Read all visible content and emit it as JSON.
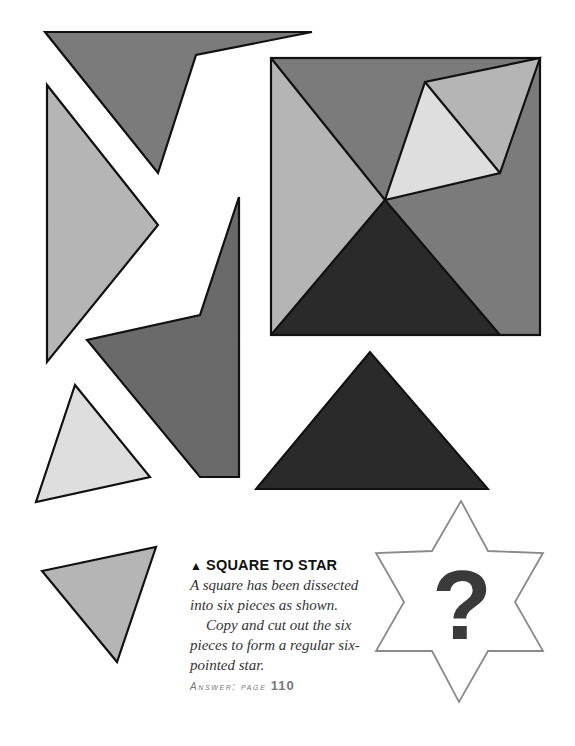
{
  "caption": {
    "title_icon": "triangle-up-icon",
    "title": "SQUARE TO STAR",
    "paragraph1": "A square has been dissected into six pieces as shown.",
    "paragraph2": "Copy and cut out the six pieces to form a regular six-pointed star.",
    "answer_label": "Answer: page",
    "answer_page": "110"
  },
  "star": {
    "symbol": "?"
  },
  "colors": {
    "medium": "#7b7b7b",
    "light": "#b5b5b5",
    "lightest": "#dedede",
    "dark": "#2a2a2a",
    "darkmid": "#6a6a6a",
    "outline": "#111111",
    "star_outline": "#8a8a8a",
    "question": "#3a3a3a"
  }
}
